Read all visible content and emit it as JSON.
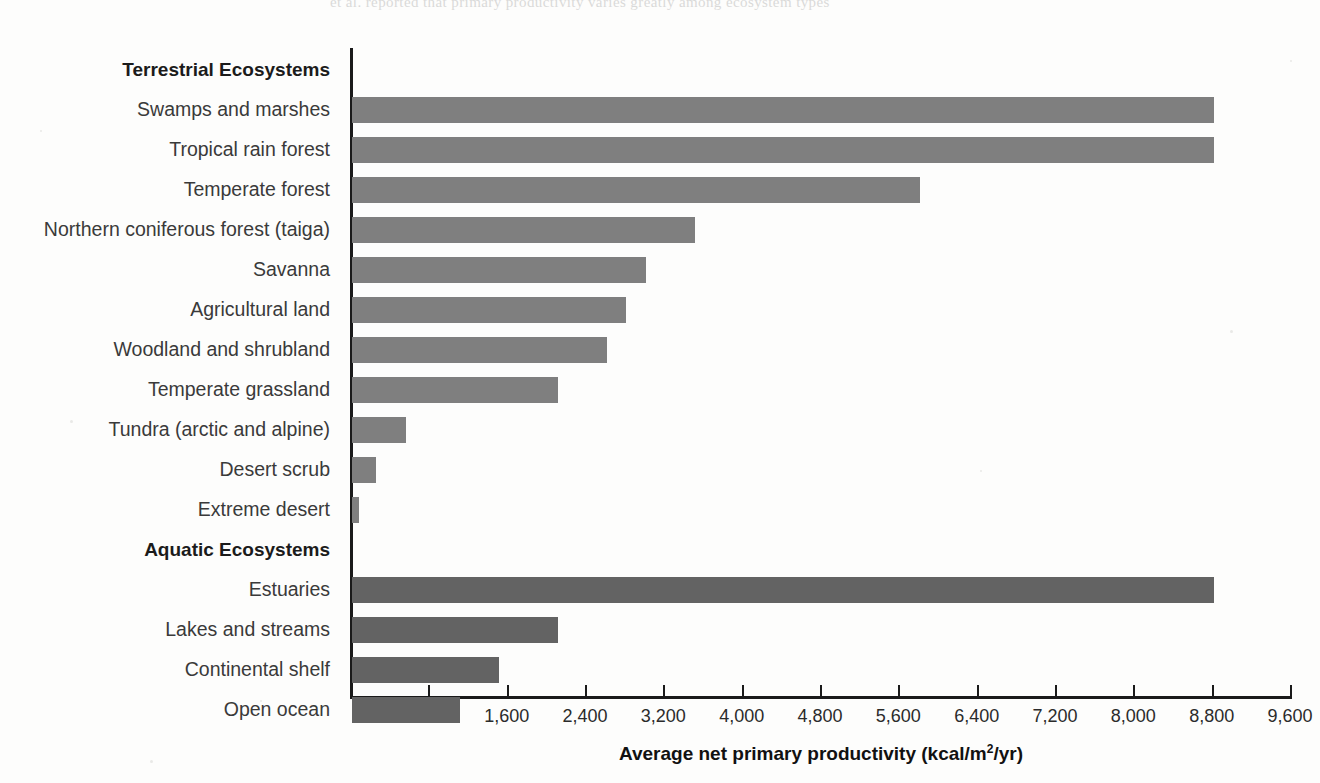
{
  "figure": {
    "ghost_line": "et al. reported that primary productivity varies greatly among ecosystem types",
    "terrestrial_heading": "Terrestrial Ecosystems",
    "aquatic_heading": "Aquatic Ecosystems",
    "terrestrial_color": "#7f7f7f",
    "aquatic_color": "#636363",
    "axis_color": "#1a1a1a"
  },
  "chart_data": {
    "type": "bar",
    "orientation": "horizontal",
    "title": "",
    "xlabel": "Average net primary productivity (kcal/m2/yr)",
    "xlabel_parts": {
      "before": "Average net primary productivity (kcal/m",
      "sup": "2",
      "after": "/yr)"
    },
    "ylabel": "",
    "xlim": [
      0,
      9600
    ],
    "xticks": [
      800,
      1600,
      2400,
      3200,
      4000,
      4800,
      5600,
      6400,
      7200,
      8000,
      8800,
      9600
    ],
    "xtick_labels": [
      "800",
      "1,600",
      "2,400",
      "3,200",
      "4,000",
      "4,800",
      "5,600",
      "6,400",
      "7,200",
      "8,000",
      "8,800",
      "9,600"
    ],
    "grid": false,
    "legend": "none",
    "groups": [
      {
        "name": "Terrestrial Ecosystems",
        "color": "#7f7f7f",
        "categories": [
          "Swamps and marshes",
          "Tropical rain forest",
          "Temperate forest",
          "Northern coniferous forest (taiga)",
          "Savanna",
          "Agricultural land",
          "Woodland and shrubland",
          "Temperate grassland",
          "Tundra (arctic and alpine)",
          "Desert scrub",
          "Extreme desert"
        ],
        "values": [
          8800,
          8800,
          5800,
          3500,
          3000,
          2800,
          2600,
          2100,
          550,
          250,
          70
        ]
      },
      {
        "name": "Aquatic Ecosystems",
        "color": "#636363",
        "categories": [
          "Estuaries",
          "Lakes and streams",
          "Continental shelf",
          "Open ocean"
        ],
        "values": [
          8800,
          2100,
          1500,
          1100
        ]
      }
    ]
  }
}
